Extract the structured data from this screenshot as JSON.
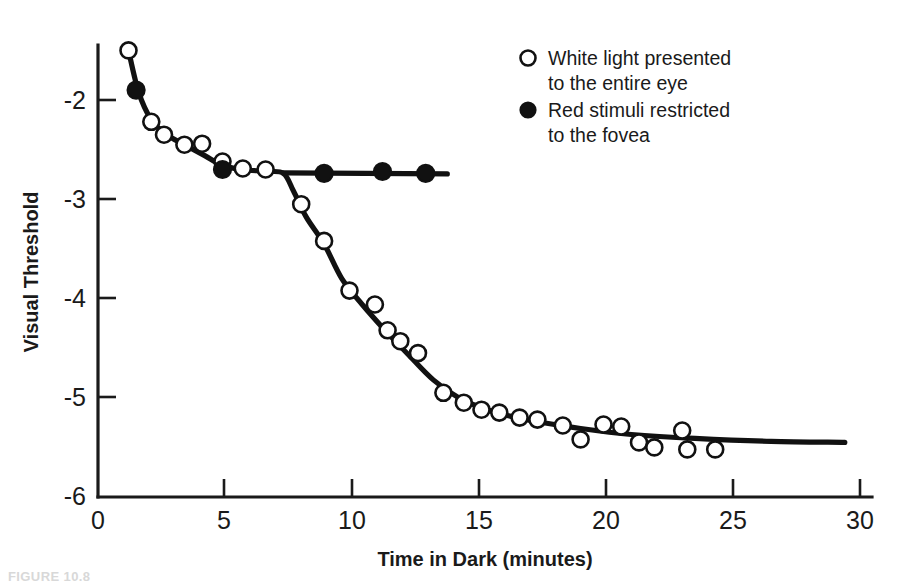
{
  "figure": {
    "caption_partial": "FIGURE 10.8"
  },
  "axes": {
    "x_title": "Time in Dark (minutes)",
    "y_title": "Visual Threshold",
    "x_ticks": [
      "0",
      "5",
      "10",
      "15",
      "20",
      "25",
      "30"
    ],
    "y_ticks": [
      "-2",
      "-3",
      "-4",
      "-5",
      "-6"
    ]
  },
  "legend": {
    "items": [
      {
        "marker": "open-circle",
        "line1": "White light presented",
        "line2": "to the entire eye"
      },
      {
        "marker": "filled-circle",
        "line1": "Red stimuli restricted",
        "line2": "to the fovea"
      }
    ]
  },
  "colors": {
    "ink": "#111111",
    "background": "#ffffff"
  },
  "chart_data": {
    "type": "scatter",
    "title": "",
    "xlabel": "Time in Dark (minutes)",
    "ylabel": "Visual Threshold",
    "xlim": [
      0,
      30
    ],
    "ylim": [
      -6,
      -1.3
    ],
    "grid": false,
    "legend_position": "upper-right",
    "xticks": [
      0,
      5,
      10,
      15,
      20,
      25,
      30
    ],
    "yticks": [
      -2,
      -3,
      -4,
      -5,
      -6
    ],
    "series": [
      {
        "name": "White light presented to the entire eye",
        "marker": "open-circle",
        "points": [
          [
            1.2,
            -1.5
          ],
          [
            2.1,
            -2.22
          ],
          [
            2.6,
            -2.35
          ],
          [
            3.4,
            -2.45
          ],
          [
            4.1,
            -2.44
          ],
          [
            4.9,
            -2.62
          ],
          [
            5.7,
            -2.69
          ],
          [
            6.6,
            -2.7
          ],
          [
            8.0,
            -3.05
          ],
          [
            8.9,
            -3.42
          ],
          [
            9.9,
            -3.92
          ],
          [
            10.9,
            -4.06
          ],
          [
            11.4,
            -4.32
          ],
          [
            11.9,
            -4.43
          ],
          [
            12.6,
            -4.55
          ],
          [
            13.6,
            -4.95
          ],
          [
            14.4,
            -5.05
          ],
          [
            15.1,
            -5.12
          ],
          [
            15.8,
            -5.15
          ],
          [
            16.6,
            -5.2
          ],
          [
            17.3,
            -5.22
          ],
          [
            18.3,
            -5.28
          ],
          [
            19.0,
            -5.42
          ],
          [
            19.9,
            -5.27
          ],
          [
            20.6,
            -5.29
          ],
          [
            21.3,
            -5.45
          ],
          [
            21.9,
            -5.5
          ],
          [
            23.0,
            -5.33
          ],
          [
            23.2,
            -5.52
          ],
          [
            24.3,
            -5.52
          ]
        ]
      },
      {
        "name": "Red stimuli restricted to the fovea",
        "marker": "filled-circle",
        "points": [
          [
            1.5,
            -1.9
          ],
          [
            4.9,
            -2.7
          ],
          [
            8.9,
            -2.74
          ],
          [
            11.2,
            -2.72
          ],
          [
            12.9,
            -2.74
          ]
        ]
      }
    ],
    "fitted_curves": [
      {
        "name": "cone-rod combined curve",
        "description": "Upper cone branch falling from -1.5 at 1.2 min to plateau near -2.72, then rod branch breaking downward at about 7.5 min to a final plateau near -5.45"
      },
      {
        "name": "cone plateau line",
        "description": "Flat line at about -2.73 from the rod-cone break at 7.5 min to 13.8 min"
      }
    ],
    "annotations": [
      {
        "label": "rod-cone break",
        "x": 7.5,
        "y": -2.75
      }
    ]
  }
}
